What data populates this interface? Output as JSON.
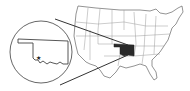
{
  "map": {
    "type": "locator-map",
    "region": "United States",
    "highlighted_state": "Oklahoma",
    "inset_label": "Oklahoma",
    "marker": "star",
    "colors": {
      "background": "#ffffff",
      "outline": "#555555",
      "state_border": "#9a9a9a",
      "highlight": "#2a2a2a",
      "leader_line": "#333333"
    }
  }
}
